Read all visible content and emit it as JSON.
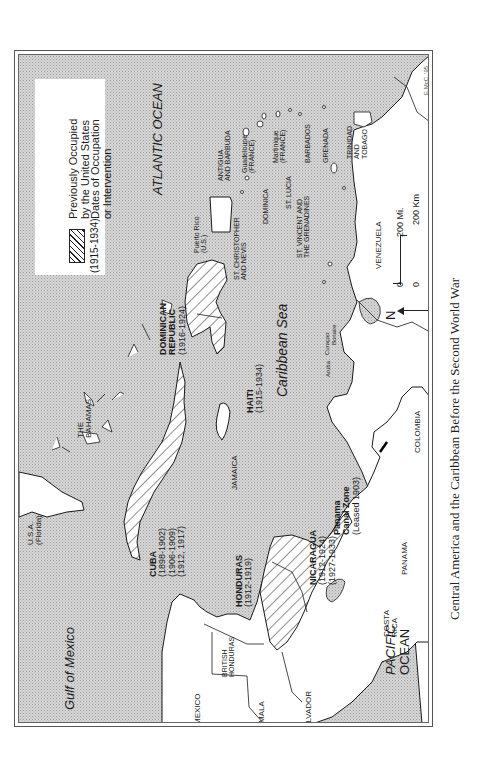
{
  "caption": "Central America and the Caribbean Before the Second World War",
  "legend": {
    "swatch": "hatched-pattern",
    "occupied_label_1": "Previously Occupied",
    "occupied_label_2": "by the United States",
    "dates_example": "(1915-1934)",
    "dates_label_1": "Dates of Occupation",
    "dates_label_2": "or Intervention"
  },
  "water": {
    "atlantic": "ATLANTIC   OCEAN",
    "caribbean": "Caribbean Sea",
    "gulf": "Gulf of Mexico",
    "pacific_1": "PACIFIC",
    "pacific_2": "OCEAN"
  },
  "occupied": {
    "cuba": {
      "name": "CUBA",
      "dates": [
        "(1898-1902)",
        "(1906-1909)",
        "(1912, 1917)"
      ]
    },
    "dominican_republic": {
      "name_1": "DOMINICAN",
      "name_2": "REPUBLIC",
      "dates": "(1916-1924)"
    },
    "haiti": {
      "name": "HAITI",
      "dates": "(1915-1934)"
    },
    "honduras": {
      "name": "HONDURAS",
      "dates": "(1912-1919)"
    },
    "nicaragua": {
      "name": "NICARAGUA",
      "dates": [
        "(1912-1924)",
        "(1927-1933)"
      ]
    },
    "panama_canal": {
      "name_1": "Panama",
      "name_2": "Canal Zone",
      "dates": "(Leased 1903)"
    }
  },
  "places": {
    "usa_1": "U.S.A.",
    "usa_2": "(Florida)",
    "bahamas_1": "THE",
    "bahamas_2": "BAHAMAS",
    "jamaica": "JAMAICA",
    "puerto_rico_1": "Puerto Rico",
    "puerto_rico_2": "(U.S.)",
    "st_christopher_1": "ST. CHRISTOPHER",
    "st_christopher_2": "AND NEVIS",
    "antigua_1": "ANTIGUA",
    "antigua_2": "AND BARBUDA",
    "guadeloupe_1": "Guadeloupe",
    "guadeloupe_2": "(FRANCE)",
    "dominica": "DOMINICA",
    "martinique_1": "Martinique",
    "martinique_2": "(FRANCE)",
    "st_lucia": "ST. LUCIA",
    "st_vincent_1": "ST. VINCENT AND",
    "st_vincent_2": "THE GRENADINES",
    "barbados": "BARBADOS",
    "grenada": "GRENADA",
    "trinidad_1": "TRINIDAD",
    "trinidad_2": "AND",
    "trinidad_3": "TOBAGO",
    "venezuela": "VENEZUELA",
    "colombia": "COLOMBIA",
    "aruba": "Aruba",
    "curacao": "Curaçao",
    "bonaire": "Bonaire",
    "panama": "PANAMA",
    "costa_rica_1": "COSTA",
    "costa_rica_2": "RICA",
    "el_salvador": "EL SALVADOR",
    "guatemala": "GUATEMALA",
    "mexico": "MEXICO",
    "british_honduras_1": "BRITISH",
    "british_honduras_2": "HONDURAS"
  },
  "scale": {
    "miles_zero": "0",
    "miles_label": "200 Mi.",
    "km_zero": "0",
    "km_label": "200 Km"
  },
  "north": "N",
  "credit": "E.McC. '95",
  "colors": {
    "water": "#c9c9c9",
    "land": "#ffffff",
    "outline": "#1a1a1a",
    "hatch": "#222222"
  }
}
